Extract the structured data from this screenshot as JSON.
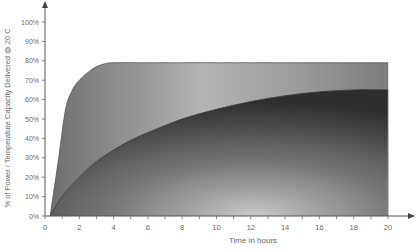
{
  "chart_data": {
    "type": "area",
    "title": "",
    "xlabel": "Time in hours",
    "ylabel": "% of Power / Temperature Capacity Delivered @ 20 C",
    "xlim": [
      0,
      20
    ],
    "ylim": [
      0,
      100
    ],
    "x_ticks": [
      "0",
      "2",
      "4",
      "6",
      "8",
      "10",
      "12",
      "14",
      "16",
      "18",
      "20"
    ],
    "y_ticks": [
      "0%",
      "10%",
      "20%",
      "30%",
      "40%",
      "50%",
      "60%",
      "70%",
      "80%",
      "90%",
      "100%"
    ],
    "grid": false,
    "legend": null,
    "series": [
      {
        "name": "outer-curve",
        "x": [
          0.3,
          0.8,
          1.2,
          1.6,
          2,
          2.5,
          3,
          3.5,
          4,
          6,
          8,
          10,
          12,
          14,
          16,
          18,
          20
        ],
        "values": [
          0,
          30,
          55,
          65,
          70,
          74,
          77,
          78.5,
          79,
          79,
          79,
          79,
          79,
          79,
          79,
          79,
          79
        ]
      },
      {
        "name": "inner-curve",
        "x": [
          0.3,
          1,
          2,
          3,
          4,
          5,
          6,
          8,
          10,
          12,
          14,
          16,
          18,
          20
        ],
        "values": [
          0,
          10,
          20,
          28,
          34,
          39,
          43,
          50,
          55,
          59,
          62,
          64,
          65,
          65
        ]
      }
    ]
  },
  "axes": {
    "xlabel": "Time in hours",
    "ylabel": "% of Power / Temperature Capacity Delivered @ 20 C"
  }
}
